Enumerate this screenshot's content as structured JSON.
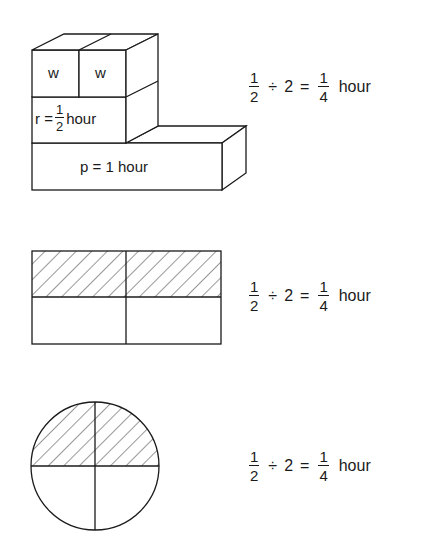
{
  "figure": {
    "block_model": {
      "cubes": [
        {
          "label": "w"
        },
        {
          "label": "w"
        }
      ],
      "r_block": {
        "prefix": "r =",
        "fraction": {
          "num": "1",
          "den": "2"
        },
        "unit": "hour"
      },
      "p_block": {
        "label": "p = 1 hour"
      }
    },
    "rectangle_model": {
      "rows": 2,
      "cols": 2,
      "shaded_row": "top"
    },
    "circle_model": {
      "sectors": 4,
      "shaded_half": "top"
    },
    "equations": [
      {
        "a": {
          "num": "1",
          "den": "2"
        },
        "op": "÷",
        "b": "2",
        "eq": "=",
        "result": {
          "num": "1",
          "den": "4"
        },
        "unit": "hour"
      },
      {
        "a": {
          "num": "1",
          "den": "2"
        },
        "op": "÷",
        "b": "2",
        "eq": "=",
        "result": {
          "num": "1",
          "den": "4"
        },
        "unit": "hour"
      },
      {
        "a": {
          "num": "1",
          "den": "2"
        },
        "op": "÷",
        "b": "2",
        "eq": "=",
        "result": {
          "num": "1",
          "den": "4"
        },
        "unit": "hour"
      }
    ],
    "colors": {
      "stroke": "#1a1a1a",
      "background": "#ffffff"
    }
  }
}
